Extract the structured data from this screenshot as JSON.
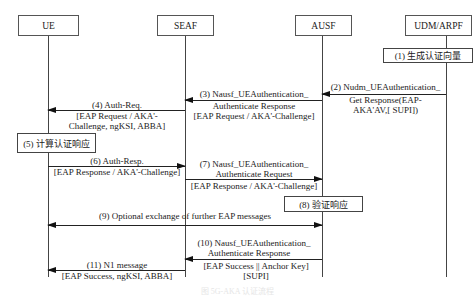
{
  "entities": [
    {
      "id": "ue",
      "label": "UE"
    },
    {
      "id": "seaf",
      "label": "SEAF"
    },
    {
      "id": "ausf",
      "label": "AUSF"
    },
    {
      "id": "udm",
      "label": "UDM/ARPF"
    }
  ],
  "steps": {
    "s1": {
      "label": "(1) 生成认证向量"
    },
    "s2": {
      "line1": "(2) Nudm_UEAuthentication_",
      "line2": "Get Response(EAP-",
      "line3": "AKA'AV,[ SUPI])"
    },
    "s3": {
      "line1": "(3) Nausf_UEAuthentication_",
      "line2": "Authenticate Response",
      "line3": "[EAP Request / AKA'-Challenge]"
    },
    "s4": {
      "line1": "(4) Auth-Req.",
      "line2": "[EAP Request / AKA'-",
      "line3": "Challenge, ngKSI, ABBA]"
    },
    "s5": {
      "label": "(5) 计算认证响应"
    },
    "s6": {
      "line1": "(6) Auth-Resp.",
      "line2": "[EAP Response / AKA'-Challenge]"
    },
    "s7": {
      "line1": "(7) Nausf_UEAuthentication_",
      "line2": "Authenticate Request",
      "line3": "[EAP Response / AKA'-Challenge]"
    },
    "s8": {
      "label": "(8) 验证响应"
    },
    "s9": {
      "line1": "(9) Optional exchange of further EAP messages"
    },
    "s10": {
      "line1": "(10) Nausf_UEAuthentication_",
      "line2": "Authenticate Response",
      "line3": "[EAP Success || Anchor Key]",
      "line4": "[SUPI]"
    },
    "s11": {
      "line1": "(11) N1 message",
      "line2": "[EAP Success, ngKSI, ABBA]"
    }
  },
  "caption": "图  5G-AKA 认证流程"
}
